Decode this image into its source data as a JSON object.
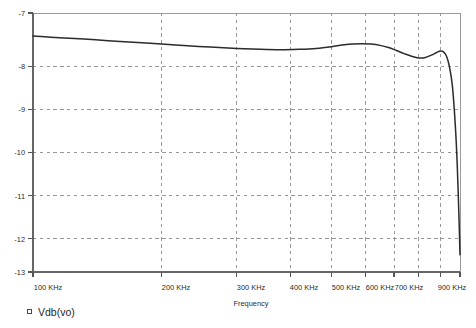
{
  "chart_data": {
    "type": "line",
    "title": "",
    "xlabel": "Frequency",
    "ylabel": "",
    "xscale": "log",
    "xunit": "KHz",
    "xlim": [
      100,
      1000
    ],
    "ylim": [
      -13,
      -7
    ],
    "grid": true,
    "legend_position": "below-left",
    "yticks": [
      -7,
      -8,
      -9,
      -10,
      -11,
      -12,
      -13
    ],
    "ytick_labels": [
      "-7",
      "-8",
      "-9",
      "-10",
      "-11",
      "-12",
      "-13"
    ],
    "xticks": [
      100,
      200,
      300,
      400,
      500,
      600,
      700,
      900
    ],
    "xtick_labels": [
      "100 KHz",
      "200 KHz",
      "300 KHz",
      "400 KHz",
      "500 KHz",
      "600 KHz",
      "700 KHz",
      "900 KHz"
    ],
    "series": [
      {
        "name": "Vdb(vo)",
        "color": "#2b2b2b",
        "marker": "square-open",
        "x": [
          100,
          110,
          125,
          140,
          160,
          180,
          200,
          230,
          260,
          300,
          340,
          380,
          420,
          460,
          500,
          530,
          560,
          590,
          620,
          650,
          680,
          710,
          740,
          770,
          800,
          830,
          860,
          880,
          900,
          915,
          930,
          945,
          960,
          975,
          985,
          995,
          1000
        ],
        "y": [
          -7.53,
          -7.56,
          -7.59,
          -7.62,
          -7.66,
          -7.69,
          -7.72,
          -7.76,
          -7.79,
          -7.82,
          -7.84,
          -7.85,
          -7.84,
          -7.82,
          -7.78,
          -7.74,
          -7.72,
          -7.71,
          -7.72,
          -7.75,
          -7.8,
          -7.87,
          -7.94,
          -8.0,
          -8.04,
          -8.03,
          -7.97,
          -7.92,
          -7.88,
          -7.9,
          -8.0,
          -8.25,
          -8.7,
          -9.6,
          -10.5,
          -11.8,
          -12.6
        ]
      }
    ]
  },
  "legend": {
    "entries": [
      {
        "label": "Vdb(vo)",
        "marker": "square-open-marker"
      }
    ]
  },
  "axes": {
    "x_title": "Frequency"
  }
}
